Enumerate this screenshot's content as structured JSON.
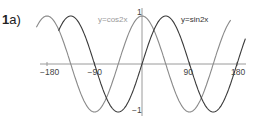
{
  "question": {
    "number": "1",
    "part": "a)"
  },
  "colors": {
    "axis": "#9a9a9a",
    "cos_curve": "#8a8a8a",
    "sin_curve": "#3a3a3a",
    "cos_label": "#999999",
    "sin_label": "#333333"
  },
  "labels": {
    "cos": "y=cos2x",
    "sin": "y=sin2x"
  },
  "chart_data": {
    "type": "line",
    "title": "",
    "xlabel": "",
    "ylabel": "",
    "x_ticks": [
      -180,
      -90,
      90,
      180
    ],
    "x_tick_labels": [
      "−180",
      "−90",
      "90",
      "180"
    ],
    "y_ticks": [
      1,
      -1
    ],
    "y_tick_labels": [
      "1",
      "−1"
    ],
    "xlim": [
      -195,
      200
    ],
    "ylim": [
      -1,
      1
    ],
    "grid": false,
    "series": [
      {
        "name": "y=cos2x",
        "function": "cos(2x)",
        "x": [
          -180,
          -135,
          -90,
          -45,
          0,
          45,
          90,
          135,
          180
        ],
        "values": [
          1,
          0,
          -1,
          0,
          1,
          0,
          -1,
          0,
          1
        ]
      },
      {
        "name": "y=sin2x",
        "function": "sin(2x)",
        "x": [
          -180,
          -135,
          -90,
          -45,
          0,
          45,
          90,
          135,
          180
        ],
        "values": [
          0,
          1,
          0,
          -1,
          0,
          1,
          0,
          -1,
          0
        ]
      }
    ],
    "annotations": [
      "y=cos2x",
      "y=sin2x"
    ]
  }
}
